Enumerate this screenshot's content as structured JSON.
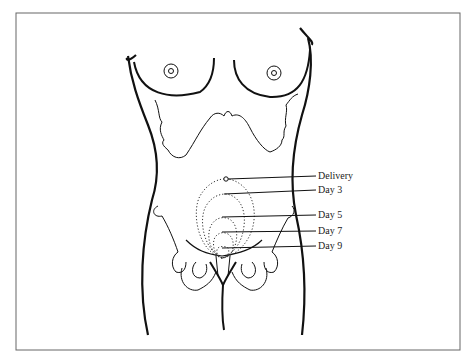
{
  "figure": {
    "labels": [
      {
        "id": "delivery",
        "text": "Delivery",
        "x": 318,
        "y": 171,
        "marker_x": 226,
        "marker_y": 179
      },
      {
        "id": "day3",
        "text": "Day 3",
        "x": 318,
        "y": 185,
        "marker_x": 224,
        "marker_y": 194
      },
      {
        "id": "day5",
        "text": "Day 5",
        "x": 318,
        "y": 210,
        "marker_x": 222,
        "marker_y": 217
      },
      {
        "id": "day7",
        "text": "Day 7",
        "x": 318,
        "y": 226,
        "marker_x": 222,
        "marker_y": 232
      },
      {
        "id": "day9",
        "text": "Day 9",
        "x": 318,
        "y": 241,
        "marker_x": 222,
        "marker_y": 248
      }
    ],
    "colors": {
      "line": "#111111",
      "frame": "#555555",
      "background": "#ffffff"
    }
  }
}
